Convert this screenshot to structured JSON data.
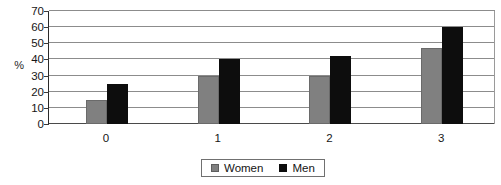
{
  "chart_data": {
    "type": "bar",
    "title": "",
    "subtitle": "",
    "xlabel": "",
    "ylabel": "%",
    "categories": [
      "0",
      "1",
      "2",
      "3"
    ],
    "series": [
      {
        "name": "Women",
        "color": "#808080",
        "values": [
          15,
          30,
          30,
          47
        ]
      },
      {
        "name": "Men",
        "color": "#0d0d0d",
        "values": [
          25,
          40,
          42,
          60
        ]
      }
    ],
    "ylim": [
      0,
      70
    ],
    "ytick_values": [
      0,
      10,
      20,
      30,
      40,
      50,
      60,
      70
    ],
    "ytick_labels": [
      "0",
      "10",
      "20",
      "30",
      "40",
      "50",
      "60",
      "70"
    ],
    "grid": "horizontal",
    "legend_position": "bottom-center",
    "legend_entries": [
      "Women",
      "Men"
    ],
    "annotations": []
  },
  "axes": {
    "y_title": "%",
    "y_ticks": [
      "70",
      "60",
      "50",
      "40",
      "30",
      "20",
      "10",
      "0"
    ],
    "x_ticks": [
      "0",
      "1",
      "2",
      "3"
    ]
  },
  "legend": {
    "items": [
      {
        "label": "Women",
        "swatch": "women-swatch"
      },
      {
        "label": "Men",
        "swatch": "men-swatch"
      }
    ]
  }
}
